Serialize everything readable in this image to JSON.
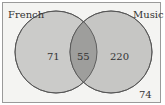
{
  "diagram": {
    "type": "venn",
    "sets": [
      {
        "name": "French",
        "only_count": "71"
      },
      {
        "name": "Music",
        "only_count": "220"
      }
    ],
    "intersection_count": "55",
    "outside_count": "74",
    "colors": {
      "background": "#f4f4f2",
      "circle_fill": "#c9c9c7",
      "intersection_fill": "#9e9e9c",
      "stroke": "#555555"
    }
  }
}
